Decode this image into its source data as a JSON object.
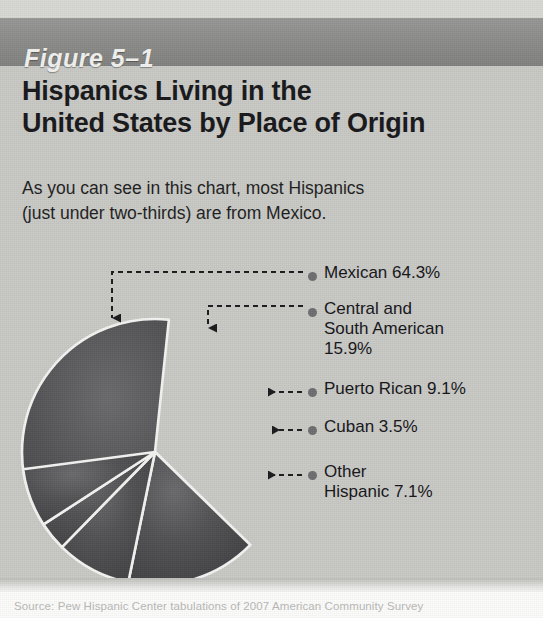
{
  "figure": {
    "bar_label": "Figure 5–1",
    "title_line1": "Hispanics Living in the",
    "title_line2": "United States by Place of Origin",
    "subtitle_line1": "As you can see in this chart, most Hispanics",
    "subtitle_line2": "(just under two-thirds) are from Mexico.",
    "source": "Source: Pew Hispanic Center tabulations of 2007 American Community Survey"
  },
  "colors": {
    "page_background": "#c9c9c6",
    "header_bar": "#8d8d8b",
    "header_text": "#f2f2f0",
    "title_text": "#17171a",
    "slice_fill": "#4a4a4c",
    "slice_edge": "#f4f4f2",
    "leader_line": "#1a1a1c",
    "marker_dot": "#6e6e70",
    "source_text": "#b9b9b6"
  },
  "labels": [
    {
      "name": "mexican",
      "text": "Mexican 64.3%"
    },
    {
      "name": "central",
      "text": "Central and\nSouth American\n15.9%"
    },
    {
      "name": "puerto",
      "text": "Puerto Rican 9.1%"
    },
    {
      "name": "cuban",
      "text": "Cuban 3.5%"
    },
    {
      "name": "other",
      "text": "Other\nHispanic 7.1%"
    }
  ],
  "chart_data": {
    "type": "pie",
    "title": "Hispanics Living in the United States by Place of Origin",
    "subtitle": "As you can see in this chart, most Hispanics (just under two-thirds) are from Mexico.",
    "unit": "percent",
    "categories": [
      "Mexican",
      "Central and South American",
      "Puerto Rican",
      "Cuban",
      "Other Hispanic"
    ],
    "values": [
      64.3,
      15.9,
      9.1,
      3.5,
      7.1
    ],
    "labels": [
      "Mexican 64.3%",
      "Central and South American 15.9%",
      "Puerto Rican 9.1%",
      "Cuban 3.5%",
      "Other Hispanic 7.1%"
    ],
    "total": 99.9,
    "start_angle_deg": -84,
    "direction": "counterclockwise-for-largest",
    "legend": "right-with-leader-lines",
    "grid": false,
    "source": "Pew Hispanic Center tabulations of 2007 American Community Survey"
  }
}
